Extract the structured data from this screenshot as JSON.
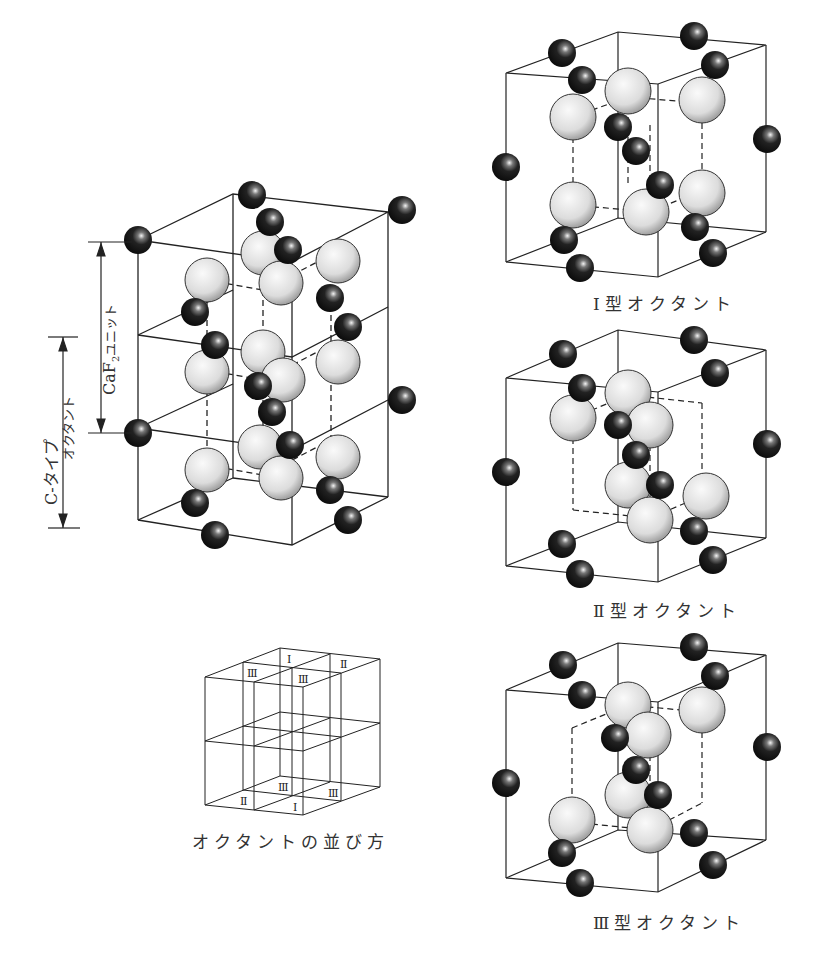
{
  "figure": {
    "main_structure": {
      "name": "C-type structure (8 octants stacked)",
      "dim_labels": {
        "caf2_unit": "CaF",
        "caf2_sub": "2",
        "caf2_suffix": "ユニット",
        "c_type": "C-タイプ",
        "octant": "オクタント"
      }
    },
    "octants": [
      {
        "id": "I",
        "caption": "Ⅰ型オクタント"
      },
      {
        "id": "II",
        "caption": "Ⅱ型オクタント"
      },
      {
        "id": "III",
        "caption": "Ⅲ型オクタント"
      }
    ],
    "arrangement": {
      "caption": "オクタントの並び方",
      "top_labels": [
        "Ⅰ",
        "Ⅱ",
        "Ⅲ",
        "Ⅲ"
      ],
      "bottom_labels": [
        "Ⅲ",
        "Ⅲ",
        "Ⅱ",
        "Ⅰ"
      ]
    },
    "legend_colors": {
      "cation": "#1a1a1a",
      "anion": "#e6e6e6",
      "lines": "#222222"
    }
  }
}
